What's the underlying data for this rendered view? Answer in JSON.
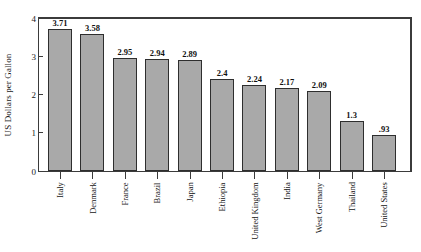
{
  "chart_data": {
    "type": "bar",
    "title": "",
    "subtitle": "",
    "xlabel": "",
    "ylabel": "US Dollars per Gallon",
    "ylim": [
      0,
      4
    ],
    "yticks": [
      "0",
      "1",
      "2",
      "3",
      "4"
    ],
    "grid": false,
    "legend": null,
    "categories": [
      "Italy",
      "Denmark",
      "France",
      "Brazil",
      "Japan",
      "Ethiopia",
      "United Kingdom",
      "India",
      "West Germany",
      "Thailand",
      "United States"
    ],
    "values": [
      3.71,
      3.58,
      2.95,
      2.94,
      2.89,
      2.4,
      2.24,
      2.17,
      2.09,
      1.3,
      0.93
    ],
    "value_labels": [
      "3.71",
      "3.58",
      "2.95",
      "2.94",
      "2.89",
      "2.4",
      "2.24",
      "2.17",
      "2.09",
      "1.3",
      ".93"
    ],
    "bar_color": "#a9a9a9",
    "bar_edge_color": "#2e2e2e",
    "axis_color": "#3b3b3b"
  }
}
